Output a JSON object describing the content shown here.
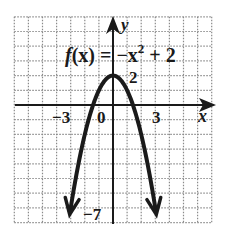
{
  "chart_data": {
    "type": "line",
    "function": "-x^2 + 2",
    "xlabel": "x",
    "ylabel": "y",
    "xlim": [
      -7,
      7
    ],
    "ylim": [
      -8,
      6
    ],
    "grid": true,
    "grid_style": "dotted",
    "tick_labels": {
      "x": [
        "-3",
        "0",
        "3"
      ],
      "y": [
        "2",
        "-7"
      ]
    },
    "series": [
      {
        "name": "f(x) = -x^2 + 2",
        "x": [
          -3.1,
          -3,
          -2,
          -1,
          0,
          1,
          2,
          3,
          3.1
        ],
        "values": [
          -7.61,
          -7,
          -2,
          1,
          2,
          1,
          -2,
          -7,
          -7.61
        ]
      }
    ],
    "annotations": [
      "vertex (0, 2)",
      "arrows at both ends pointing down"
    ]
  },
  "labels": {
    "equation_f": "f",
    "equation_rest": "(x) = −x",
    "equation_exp": "2",
    "equation_tail": " + 2",
    "y_axis": "y",
    "x_axis": "x",
    "tick_neg3": "−3",
    "tick_0": "0",
    "tick_3": "3",
    "tick_2": "2",
    "tick_neg7": "−7"
  },
  "colors": {
    "curve": "#1a1a1a",
    "grid": "#8a8a8a",
    "axis": "#1a1a1a"
  }
}
